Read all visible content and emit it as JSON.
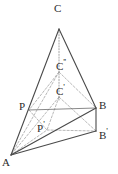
{
  "figure": {
    "type": "geometry-diagram",
    "canvas": {
      "width": 118,
      "height": 174
    },
    "colors": {
      "solid_stroke": "#4a4a4a",
      "thin_stroke": "#6b6b6b",
      "dashed_stroke": "#9a9a9a",
      "dotted_stroke": "#8f8f8f",
      "label_color": "#2b2b2b",
      "background": "#ffffff"
    },
    "vertices": [
      {
        "id": "C",
        "name": "apex-c",
        "label": "C",
        "prime": "",
        "x": 59,
        "y": 29,
        "label_x": 54,
        "label_y": 3
      },
      {
        "id": "C2",
        "name": "point-c-double",
        "label": "C",
        "prime": "''",
        "x": 59,
        "y": 72,
        "label_x": 56,
        "label_y": 57
      },
      {
        "id": "C1",
        "name": "point-c-prime",
        "label": "C",
        "prime": "'",
        "x": 59,
        "y": 97,
        "label_x": 56,
        "label_y": 82
      },
      {
        "id": "P",
        "name": "point-p",
        "label": "P",
        "prime": "",
        "x": 29,
        "y": 110,
        "label_x": 19,
        "label_y": 101
      },
      {
        "id": "B",
        "name": "point-b",
        "label": "B",
        "prime": "",
        "x": 96,
        "y": 108,
        "label_x": 99,
        "label_y": 100
      },
      {
        "id": "P1",
        "name": "point-p-prime",
        "label": "P",
        "prime": "'",
        "x": 47,
        "y": 130,
        "label_x": 37,
        "label_y": 119
      },
      {
        "id": "B1",
        "name": "point-b-prime",
        "label": "B",
        "prime": "'",
        "x": 96,
        "y": 131,
        "label_x": 99,
        "label_y": 126
      },
      {
        "id": "A",
        "name": "point-a",
        "label": "A",
        "prime": "",
        "x": 11,
        "y": 155,
        "label_x": 2,
        "label_y": 157
      }
    ],
    "solid_edges": [
      {
        "name": "edge-a-c",
        "x1": 11,
        "y1": 155,
        "x2": 59,
        "y2": 29
      },
      {
        "name": "edge-c-b",
        "x1": 59,
        "y1": 29,
        "x2": 96,
        "y2": 108
      },
      {
        "name": "edge-a-b",
        "x1": 11,
        "y1": 155,
        "x2": 96,
        "y2": 108
      },
      {
        "name": "edge-a-bprime",
        "x1": 11,
        "y1": 155,
        "x2": 96,
        "y2": 131
      },
      {
        "name": "edge-b-bprime",
        "x1": 96,
        "y1": 108,
        "x2": 96,
        "y2": 131
      }
    ],
    "thin_edges": [
      {
        "name": "edge-p-b",
        "x1": 29,
        "y1": 110,
        "x2": 96,
        "y2": 108
      }
    ],
    "dashed_edges": [
      {
        "name": "edge-cdouble-p",
        "x1": 59,
        "y1": 72,
        "x2": 29,
        "y2": 110
      },
      {
        "name": "edge-cdouble-b",
        "x1": 59,
        "y1": 72,
        "x2": 96,
        "y2": 108
      },
      {
        "name": "edge-cprime-pprime",
        "x1": 59,
        "y1": 97,
        "x2": 47,
        "y2": 130
      },
      {
        "name": "edge-cprime-bprime",
        "x1": 59,
        "y1": 97,
        "x2": 96,
        "y2": 131
      },
      {
        "name": "edge-cprime-a",
        "x1": 59,
        "y1": 97,
        "x2": 11,
        "y2": 155
      },
      {
        "name": "edge-cdouble-a",
        "x1": 59,
        "y1": 72,
        "x2": 11,
        "y2": 155
      },
      {
        "name": "edge-p-pprime",
        "x1": 29,
        "y1": 110,
        "x2": 47,
        "y2": 130
      },
      {
        "name": "edge-pprime-bprime",
        "x1": 47,
        "y1": 130,
        "x2": 96,
        "y2": 131
      },
      {
        "name": "edge-a-pprime-ext",
        "x1": 11,
        "y1": 155,
        "x2": 47,
        "y2": 130
      }
    ],
    "dotted_edges": [
      {
        "name": "axis-c-cprime",
        "x1": 59,
        "y1": 29,
        "x2": 59,
        "y2": 100
      }
    ]
  }
}
